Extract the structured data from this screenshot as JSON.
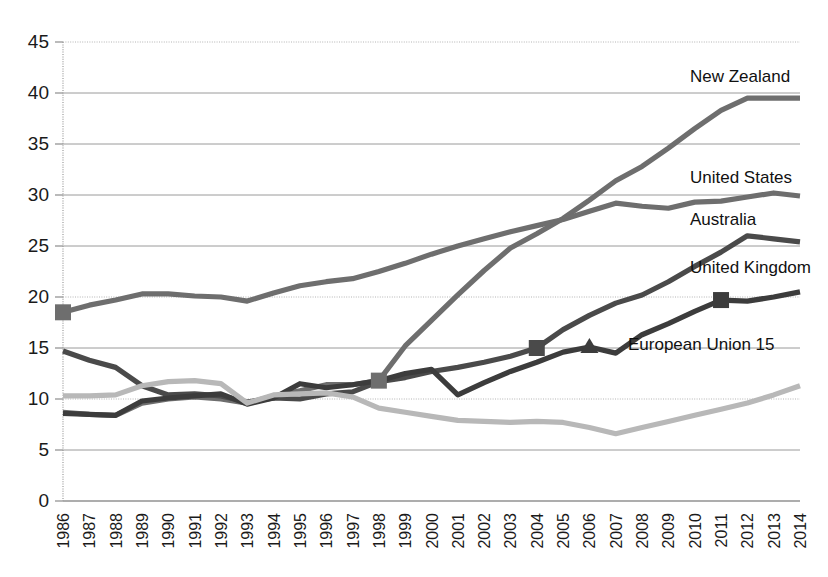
{
  "chart_data": {
    "type": "line",
    "title": "",
    "subtitle": "",
    "xlabel": "",
    "ylabel": "",
    "xlim": [
      1986,
      2014
    ],
    "ylim": [
      0,
      45
    ],
    "grid": true,
    "legend_position": "right-inline-labels",
    "y_ticks": [
      "0",
      "5",
      "10",
      "15",
      "20",
      "25",
      "30",
      "35",
      "40",
      "45"
    ],
    "categories": [
      "1986",
      "1987",
      "1988",
      "1989",
      "1990",
      "1991",
      "1992",
      "1993",
      "1994",
      "1995",
      "1996",
      "1997",
      "1998",
      "1999",
      "2000",
      "2001",
      "2002",
      "2003",
      "2004",
      "2005",
      "2006",
      "2007",
      "2008",
      "2009",
      "2010",
      "2011",
      "2012",
      "2013",
      "2014"
    ],
    "series": [
      {
        "name": "New Zealand",
        "label": "New Zealand",
        "color": "#6e6e6e",
        "label_x": 690,
        "label_y": 82,
        "marker": "square",
        "marker_years": [
          "1998"
        ],
        "values": [
          8.7,
          8.5,
          8.4,
          9.6,
          10.0,
          10.2,
          10.0,
          9.6,
          10.3,
          10.8,
          11.4,
          11.4,
          11.8,
          15.2,
          17.7,
          20.2,
          22.6,
          24.8,
          26.2,
          27.7,
          29.5,
          31.4,
          32.8,
          34.6,
          36.5,
          38.3,
          39.5,
          39.5,
          39.5
        ]
      },
      {
        "name": "United States",
        "label": "United States",
        "color": "#6e6e6e",
        "label_x": 690,
        "label_y": 183,
        "marker": "square",
        "marker_years": [
          "1986"
        ],
        "values": [
          18.5,
          19.2,
          19.7,
          20.3,
          20.3,
          20.1,
          20.0,
          19.6,
          20.4,
          21.1,
          21.5,
          21.8,
          22.5,
          23.3,
          24.2,
          25.0,
          25.7,
          26.4,
          27.0,
          27.6,
          28.4,
          29.2,
          28.9,
          28.7,
          29.3,
          29.4,
          29.8,
          30.2,
          29.9
        ]
      },
      {
        "name": "Australia",
        "label": "Australia",
        "color": "#4a4a4a",
        "label_x": 690,
        "label_y": 225,
        "marker": "square",
        "marker_years": [
          "2004"
        ],
        "values": [
          14.7,
          13.8,
          13.1,
          11.3,
          10.4,
          10.5,
          10.3,
          9.7,
          10.1,
          10.0,
          10.5,
          10.7,
          11.7,
          12.1,
          12.7,
          13.1,
          13.6,
          14.2,
          15.0,
          16.8,
          18.2,
          19.4,
          20.2,
          21.5,
          23.0,
          24.4,
          26.0,
          25.7,
          25.4
        ]
      },
      {
        "name": "United Kingdom",
        "label": "United Kingdom",
        "color": "#3c3c3c",
        "label_x": 690,
        "label_y": 273,
        "marker": "square",
        "marker_years": [
          "2011"
        ],
        "values": [
          8.6,
          8.5,
          8.4,
          9.8,
          10.1,
          10.3,
          10.5,
          9.5,
          10.1,
          11.5,
          11.1,
          11.4,
          11.8,
          12.5,
          12.9,
          10.4,
          11.6,
          12.7,
          13.6,
          14.6,
          15.1,
          14.5,
          16.3,
          17.4,
          18.6,
          19.7,
          19.6,
          20.0,
          20.5
        ]
      },
      {
        "name": "European Union 15",
        "label": "European Union 15",
        "color": "#b8b8b8",
        "label_x": 628,
        "label_y": 350,
        "marker": "none",
        "marker_years": [],
        "values": [
          10.3,
          10.3,
          10.4,
          11.3,
          11.7,
          11.8,
          11.5,
          9.6,
          10.4,
          10.5,
          10.6,
          10.2,
          9.1,
          8.7,
          8.3,
          7.9,
          7.8,
          7.7,
          7.8,
          7.7,
          7.2,
          6.6,
          7.2,
          7.8,
          8.4,
          9.0,
          9.6,
          10.4,
          11.3
        ]
      }
    ]
  },
  "colors": {
    "background": "#ffffff",
    "gridline": "#9a9a9a",
    "axis": "#8d8d8d",
    "text": "#1a1a1a"
  }
}
